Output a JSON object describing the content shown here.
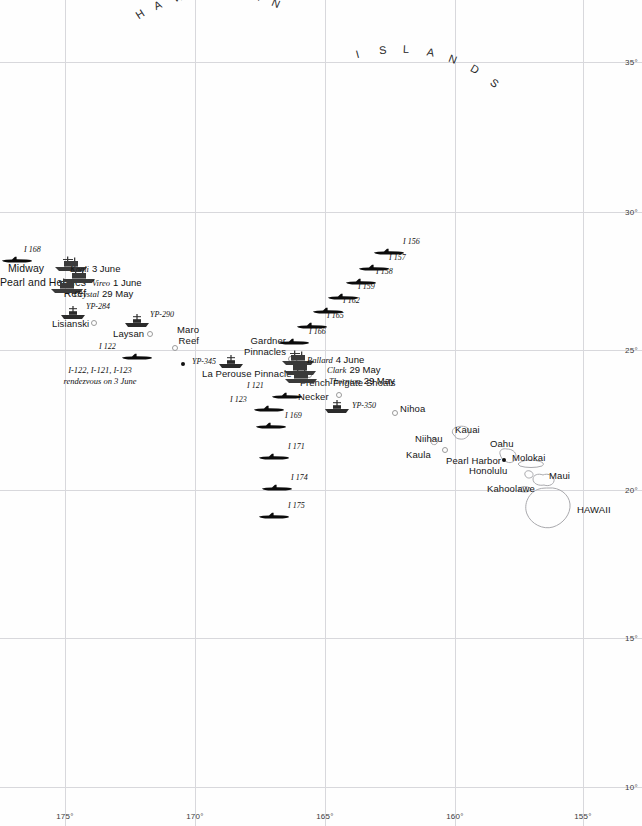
{
  "map": {
    "title": "Hawaiian Islands — Midway operation dispositions",
    "region_labels": [
      {
        "text": "HAWAIIAN",
        "name": "arc-label-hawaiian"
      },
      {
        "text": "ISLANDS",
        "name": "arc-label-islands"
      }
    ],
    "grid": {
      "latitude_labels": [
        "35°",
        "30°",
        "25°",
        "20°",
        "15°",
        "10°"
      ],
      "latitude_y": [
        62,
        212,
        350,
        490,
        638,
        787
      ],
      "longitude_labels": [
        "175°",
        "170°",
        "165°",
        "160°",
        "155°"
      ],
      "longitude_x": [
        65,
        195,
        325,
        455,
        583
      ],
      "longitude_label_y": 812,
      "grid_color": "#d8d8dc"
    },
    "islands": [
      {
        "label": "Midway",
        "x": 8,
        "y": 262,
        "size": "big",
        "marker": null
      },
      {
        "label": "Pearl and Hermes\nReef",
        "x": 0,
        "y": 277,
        "size": "big",
        "marker": null
      },
      {
        "label": "Lisianski",
        "x": 52,
        "y": 318,
        "size": "reg",
        "marker": {
          "x": 91,
          "y": 320
        }
      },
      {
        "label": "Laysan",
        "x": 113,
        "y": 328,
        "size": "reg",
        "marker": {
          "x": 147,
          "y": 331
        }
      },
      {
        "label": "Maro\nReef",
        "x": 177,
        "y": 324,
        "size": "reg",
        "marker": {
          "x": 172,
          "y": 345
        }
      },
      {
        "label": "Gardner\nPinnacles",
        "x": 244,
        "y": 335,
        "size": "reg",
        "marker": {
          "x": 288,
          "y": 356
        }
      },
      {
        "label": "La Perouse Pinnacle",
        "x": 202,
        "y": 368,
        "size": "reg",
        "marker": {
          "x": 306,
          "y": 372
        }
      },
      {
        "label": "French Frigate Shoals",
        "x": 300,
        "y": 377,
        "size": "reg",
        "marker": null
      },
      {
        "label": "Necker",
        "x": 298,
        "y": 391,
        "size": "reg",
        "marker": {
          "x": 336,
          "y": 392
        }
      },
      {
        "label": "Nihoa",
        "x": 400,
        "y": 403,
        "size": "reg",
        "marker": {
          "x": 392,
          "y": 410
        }
      },
      {
        "label": "Kauai",
        "x": 455,
        "y": 424,
        "size": "reg",
        "marker": null
      },
      {
        "label": "Niihau",
        "x": 415,
        "y": 433,
        "size": "reg",
        "marker": null
      },
      {
        "label": "Kaula",
        "x": 406,
        "y": 449,
        "size": "reg",
        "marker": {
          "x": 442,
          "y": 447
        }
      },
      {
        "label": "Oahu",
        "x": 490,
        "y": 438,
        "size": "reg",
        "marker": null
      },
      {
        "label": "Molokai",
        "x": 512,
        "y": 452,
        "size": "reg",
        "marker": null
      },
      {
        "label": "Maui",
        "x": 549,
        "y": 470,
        "size": "reg",
        "marker": null
      },
      {
        "label": "Kahoolawe",
        "x": 487,
        "y": 483,
        "size": "reg",
        "marker": null
      },
      {
        "label": "HAWAII",
        "x": 577,
        "y": 504,
        "size": "reg",
        "marker": null
      }
    ],
    "cities": [
      {
        "label": "Pearl Harbor",
        "x": 446,
        "y": 455,
        "dot": {
          "x": 502,
          "y": 458
        }
      },
      {
        "label": "Honolulu",
        "x": 469,
        "y": 465,
        "dot": null
      }
    ],
    "submarines": [
      {
        "label": "I 168",
        "label_x": 24,
        "label_y": 245,
        "icon_x": 2,
        "icon_y": 250,
        "flip": false
      },
      {
        "label": "I 122",
        "label_x": 99,
        "label_y": 342,
        "icon_x": 122,
        "icon_y": 347,
        "flip": false
      },
      {
        "label": "I 156",
        "label_x": 403,
        "label_y": 237,
        "icon_x": 374,
        "icon_y": 242,
        "flip": false
      },
      {
        "label": "I 157",
        "label_x": 389,
        "label_y": 253,
        "icon_x": 359,
        "icon_y": 258,
        "flip": false
      },
      {
        "label": "I 158",
        "label_x": 376,
        "label_y": 267,
        "icon_x": 346,
        "icon_y": 272,
        "flip": false
      },
      {
        "label": "I 159",
        "label_x": 358,
        "label_y": 282,
        "icon_x": 328,
        "icon_y": 287,
        "flip": false
      },
      {
        "label": "I 162",
        "label_x": 343,
        "label_y": 296,
        "icon_x": 313,
        "icon_y": 301,
        "flip": false
      },
      {
        "label": "I 165",
        "label_x": 327,
        "label_y": 311,
        "icon_x": 297,
        "icon_y": 316,
        "flip": false
      },
      {
        "label": "I 166",
        "label_x": 309,
        "label_y": 327,
        "icon_x": 279,
        "icon_y": 332,
        "flip": false
      },
      {
        "label": "I 121",
        "label_x": 247,
        "label_y": 381,
        "icon_x": 272,
        "icon_y": 386,
        "flip": false
      },
      {
        "label": "I 123",
        "label_x": 230,
        "label_y": 395,
        "icon_x": 254,
        "icon_y": 399,
        "flip": false
      },
      {
        "label": "I 169",
        "label_x": 285,
        "label_y": 411,
        "icon_x": 256,
        "icon_y": 416,
        "flip": false
      },
      {
        "label": "I 171",
        "label_x": 288,
        "label_y": 442,
        "icon_x": 259,
        "icon_y": 447,
        "flip": false
      },
      {
        "label": "I 174",
        "label_x": 291,
        "label_y": 473,
        "icon_x": 262,
        "icon_y": 478,
        "flip": false
      },
      {
        "label": "I 175",
        "label_x": 288,
        "label_y": 501,
        "icon_x": 259,
        "icon_y": 506,
        "flip": false
      }
    ],
    "patrol_craft": [
      {
        "label": "YP-284",
        "label_x": 86,
        "label_y": 302,
        "icon_x": 60,
        "icon_y": 306
      },
      {
        "label": "YP-290",
        "label_x": 150,
        "label_y": 310,
        "icon_x": 124,
        "icon_y": 314
      },
      {
        "label": "YP-345",
        "label_x": 192,
        "label_y": 357,
        "icon_x": 218,
        "icon_y": 355
      },
      {
        "label": "YP-350",
        "label_x": 352,
        "label_y": 401,
        "icon_x": 324,
        "icon_y": 400
      }
    ],
    "ships": [
      {
        "name": "Kaali",
        "date": "3 June",
        "name_x": 70,
        "name_y": 258,
        "icon_x": 54,
        "icon_y": 256
      },
      {
        "name": "Vireo",
        "date": "1 June",
        "name_x": 92,
        "name_y": 272,
        "icon_x": 62,
        "icon_y": 268
      },
      {
        "name": "Crystal",
        "date": "29 May",
        "name_x": 74,
        "name_y": 283,
        "icon_x": 50,
        "icon_y": 278
      },
      {
        "name": "Ballard",
        "date": "4 June",
        "name_x": 307,
        "name_y": 349,
        "icon_x": 281,
        "icon_y": 350
      },
      {
        "name": "Clark",
        "date": "29 May",
        "name_x": 327,
        "name_y": 359,
        "icon_x": 283,
        "icon_y": 360
      },
      {
        "name": "Thornton",
        "date": "29 May",
        "name_x": 329,
        "name_y": 370,
        "icon_x": 284,
        "icon_y": 368
      }
    ],
    "annotations": [
      {
        "line1": "I-122, I-121, I-123",
        "line2": "rendezvous on 3 June",
        "x": 100,
        "y": 365,
        "marker": {
          "x": 181,
          "y": 362
        }
      }
    ]
  }
}
